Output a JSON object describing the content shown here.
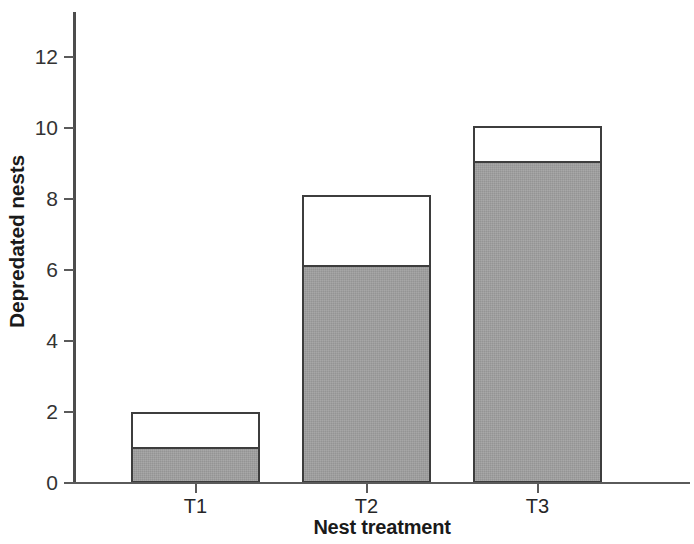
{
  "chart_data": {
    "type": "bar",
    "stacked": true,
    "title": "",
    "xlabel": "Nest treatment",
    "ylabel": "Depredated nests",
    "categories": [
      "T1",
      "T2",
      "T3"
    ],
    "series": [
      {
        "name": "lower-grey",
        "color": "#9e9e9e",
        "values": [
          1.0,
          6.1,
          9.05
        ]
      },
      {
        "name": "upper-white",
        "color": "#ffffff",
        "values": [
          1.0,
          2.0,
          1.0
        ]
      }
    ],
    "totals": [
      2.0,
      8.1,
      10.05
    ],
    "ylim": [
      0,
      13
    ],
    "yticks": [
      0,
      2,
      4,
      6,
      8,
      10,
      12
    ],
    "ytick_labels": [
      "0",
      "2",
      "4",
      "6",
      "8",
      "10",
      "12"
    ],
    "grid": false,
    "legend": "none",
    "axis_color": "#5a5a5a",
    "bar_edge_color": "#3d3d3d"
  }
}
